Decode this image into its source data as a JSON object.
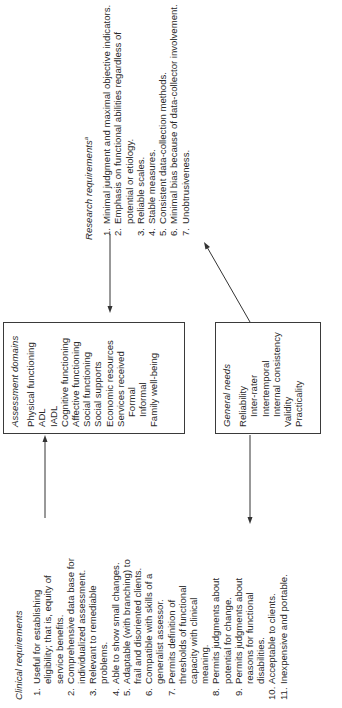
{
  "diagram": {
    "orientation": "rotated 90 degrees counter-clockwise",
    "clinical_requirements": {
      "heading": "Clinical requirements",
      "items": [
        {
          "num": "1.",
          "text": "Useful for establishing eligibility; that is, equity of service benefits."
        },
        {
          "num": "2.",
          "text": "Comprehensive data base for individualized assessment."
        },
        {
          "num": "3.",
          "text": "Relevant to remediable problems."
        },
        {
          "num": "4.",
          "text": "Able to show small changes."
        },
        {
          "num": "5.",
          "text": "Adaptable (with branching) to frail and disoriented clients."
        },
        {
          "num": "6.",
          "text": "Compatible with skills of a generalist assessor."
        },
        {
          "num": "7.",
          "text": "Permits definition of thresholds of functional capacity with clinical meaning."
        },
        {
          "num": "8.",
          "text": "Permits judgments about potential for change."
        },
        {
          "num": "9.",
          "text": "Permits judgments about reasons for functional disabilities."
        },
        {
          "num": "10.",
          "text": "Acceptable to clients."
        },
        {
          "num": "11.",
          "text": "Inexpensive and portable."
        }
      ]
    },
    "assessment_domains": {
      "heading": "Assessment domains",
      "items": [
        {
          "text": "Physical functioning",
          "indent": false
        },
        {
          "text": "ADL",
          "indent": false
        },
        {
          "text": "IADL",
          "indent": false
        },
        {
          "text": "Cognitive functioning",
          "indent": false
        },
        {
          "text": "Affective functioning",
          "indent": false
        },
        {
          "text": "Social functioning",
          "indent": false
        },
        {
          "text": "Social supports",
          "indent": false
        },
        {
          "text": "Economic resources",
          "indent": false
        },
        {
          "text": "Services received",
          "indent": false
        },
        {
          "text": "Formal",
          "indent": true
        },
        {
          "text": "Informal",
          "indent": true
        },
        {
          "text": "Family well-being",
          "indent": false
        }
      ]
    },
    "research_requirements": {
      "heading": "Research requirements",
      "heading_superscript": "a",
      "items": [
        {
          "num": "1.",
          "text": "Minimal judgment and maximal objective indicators."
        },
        {
          "num": "2.",
          "text": "Emphasis on functional abilities regardless of potential or etiology."
        },
        {
          "num": "3.",
          "text": "Reliable scales."
        },
        {
          "num": "4.",
          "text": "Stable measures."
        },
        {
          "num": "5.",
          "text": "Consistent data-collection methods."
        },
        {
          "num": "6.",
          "text": "Minimal bias because of data-collector involvement."
        },
        {
          "num": "7.",
          "text": "Unobtrusiveness."
        }
      ]
    },
    "general_needs": {
      "heading": "General needs",
      "items": [
        {
          "text": "Reliability",
          "indent": false
        },
        {
          "text": "Inter-rater",
          "indent": true
        },
        {
          "text": "Intertemporal",
          "indent": true
        },
        {
          "text": "Internal consistency",
          "indent": true
        },
        {
          "text": "Validity",
          "indent": false
        },
        {
          "text": "Practicality",
          "indent": false
        }
      ]
    },
    "arrows": [
      {
        "from": "clinical_requirements",
        "to": "assessment_domains"
      },
      {
        "from": "research_requirements",
        "to": "assessment_domains"
      },
      {
        "from": "general_needs",
        "to": "research_requirements"
      },
      {
        "from": "general_needs",
        "to": "clinical_requirements"
      }
    ]
  }
}
